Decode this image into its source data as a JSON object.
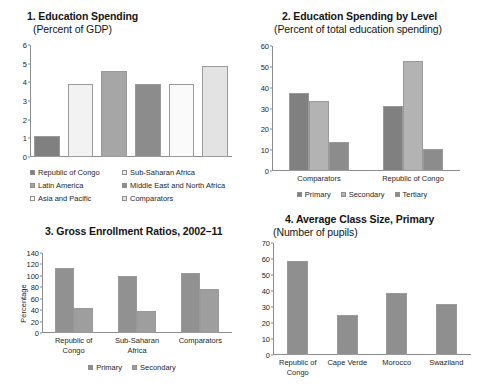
{
  "figure": {
    "panels": [
      "chart1",
      "chart2",
      "chart3",
      "chart4"
    ]
  },
  "chart_data": [
    {
      "id": "chart1",
      "type": "bar",
      "title": "1. Education Spending",
      "subtitle": "(Percent of GDP)",
      "xlabel": "",
      "ylabel": "",
      "ylim": [
        0,
        6
      ],
      "yticks": [
        "0",
        "1",
        "2",
        "3",
        "4",
        "5",
        "6"
      ],
      "grid": false,
      "legend_position": "bottom",
      "categories": [
        "Republic of Congo",
        "Sub-Saharan Africa",
        "Latin America",
        "Middle East and North Africa",
        "Asia and Pacific",
        "Comparators"
      ],
      "values": [
        1.1,
        3.9,
        4.6,
        3.9,
        3.9,
        4.9
      ],
      "colors": [
        "#808080",
        "#f2f2f2",
        "#a6a6a6",
        "#8c8c8c",
        "#fafafa",
        "#e3e3e3"
      ],
      "legend": [
        {
          "label": "Republic of Congo",
          "color": "#808080"
        },
        {
          "label": "Sub-Saharan Africa",
          "color": "#f2f2f2"
        },
        {
          "label": "Latin America",
          "color": "#a6a6a6"
        },
        {
          "label": "Middle East and North Africa",
          "color": "#8c8c8c"
        },
        {
          "label": "Asia and Pacific",
          "color": "#fafafa"
        },
        {
          "label": "Comparators",
          "color": "#e3e3e3"
        }
      ]
    },
    {
      "id": "chart2",
      "type": "bar",
      "title": "2. Education Spending by Level",
      "subtitle": "(Percent of total education spending)",
      "xlabel": "",
      "ylabel": "",
      "ylim": [
        0,
        60
      ],
      "yticks": [
        "0",
        "10",
        "20",
        "30",
        "40",
        "50",
        "60"
      ],
      "grid": false,
      "legend_position": "bottom",
      "categories": [
        "Comparators",
        "Republic of Congo"
      ],
      "series": [
        {
          "name": "Primary",
          "color": "#808080",
          "values": [
            37.5,
            31.0
          ]
        },
        {
          "name": "Secondary",
          "color": "#b3b3b3",
          "values": [
            33.5,
            53.0
          ]
        },
        {
          "name": "Tertiary",
          "color": "#8c8c8c",
          "values": [
            14.0,
            10.8
          ]
        }
      ]
    },
    {
      "id": "chart3",
      "type": "bar",
      "title": "3. Gross Enrollment Ratios, 2002–11",
      "subtitle": "",
      "xlabel": "",
      "ylabel": "Percentage",
      "ylim": [
        0,
        140
      ],
      "yticks": [
        "0",
        "20",
        "40",
        "60",
        "80",
        "100",
        "120",
        "140"
      ],
      "grid": false,
      "legend_position": "bottom",
      "categories": [
        "Republic of\nCongo",
        "Sub-Saharan\nAfrica",
        "Comparators"
      ],
      "series": [
        {
          "name": "Primary",
          "color": "#919191",
          "values": [
            114,
            99,
            105
          ]
        },
        {
          "name": "Secondary",
          "color": "#9e9e9e",
          "values": [
            43,
            39,
            77
          ]
        }
      ]
    },
    {
      "id": "chart4",
      "type": "bar",
      "title": "4. Average Class Size, Primary",
      "subtitle": "(Number of pupils)",
      "xlabel": "",
      "ylabel": "",
      "ylim": [
        0,
        70
      ],
      "yticks": [
        "0",
        "10",
        "20",
        "30",
        "40",
        "50",
        "60",
        "70"
      ],
      "grid": false,
      "legend_position": "none",
      "categories": [
        "Republic of\nCongo",
        "Cape Verde",
        "Morocco",
        "Swaziland"
      ],
      "values": [
        59,
        25,
        39,
        32
      ],
      "color": "#8f8f8f"
    }
  ]
}
